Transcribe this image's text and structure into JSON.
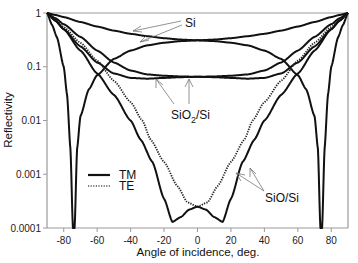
{
  "chart_data": {
    "type": "line",
    "title": "",
    "xlabel": "Angle of incidence, deg.",
    "ylabel": "Reflectivity",
    "xlim": [
      -90,
      90
    ],
    "ylim": [
      0.0001,
      1
    ],
    "yscale": "log",
    "grid": false,
    "x_ticks": [
      -80,
      -60,
      -40,
      -20,
      0,
      20,
      40,
      60,
      80
    ],
    "x_tick_labels": [
      "-80",
      "-60",
      "-40",
      "-20",
      "0",
      "20",
      "40",
      "60",
      "80"
    ],
    "y_ticks": [
      1,
      0.1,
      0.01,
      0.001,
      0.0001
    ],
    "y_tick_labels": [
      "1",
      "0.1",
      "0.01",
      "0.001",
      "0.0001"
    ],
    "legend": {
      "placement": "lower-left",
      "entries": [
        {
          "label": "TM",
          "style": "solid"
        },
        {
          "label": "TE",
          "style": "dotted"
        }
      ]
    },
    "symmetric_about_zero": true,
    "series": [
      {
        "name": "Si TE",
        "style": "solid",
        "x": [
          0,
          10,
          20,
          30,
          40,
          50,
          60,
          70,
          80,
          85,
          90
        ],
        "values": [
          0.31,
          0.32,
          0.34,
          0.37,
          0.41,
          0.47,
          0.56,
          0.68,
          0.84,
          0.92,
          1.0
        ]
      },
      {
        "name": "Si TM",
        "style": "solid",
        "x": [
          0,
          10,
          20,
          30,
          40,
          50,
          60,
          65,
          70,
          72,
          73.5,
          74.5,
          76,
          78,
          80,
          84,
          87,
          90
        ],
        "values": [
          0.31,
          0.3,
          0.28,
          0.25,
          0.2,
          0.14,
          0.07,
          0.038,
          0.012,
          0.003,
          0.0001,
          0.0001,
          0.003,
          0.03,
          0.1,
          0.35,
          0.6,
          1.0
        ]
      },
      {
        "name": "SiO2/Si TE",
        "style": "solid",
        "x": [
          0,
          10,
          20,
          30,
          40,
          50,
          60,
          70,
          80,
          85,
          90
        ],
        "values": [
          0.065,
          0.066,
          0.068,
          0.072,
          0.085,
          0.12,
          0.2,
          0.36,
          0.62,
          0.8,
          1.0
        ]
      },
      {
        "name": "SiO2/Si TM",
        "style": "solid",
        "x": [
          0,
          10,
          20,
          30,
          40,
          50,
          60,
          70,
          80,
          85,
          90
        ],
        "values": [
          0.065,
          0.064,
          0.062,
          0.06,
          0.062,
          0.075,
          0.12,
          0.24,
          0.5,
          0.72,
          1.0
        ]
      },
      {
        "name": "SiO/Si TE",
        "style": "dotted",
        "x": [
          0,
          6,
          12,
          20,
          28,
          33,
          40,
          50,
          60,
          70,
          80,
          85,
          90
        ],
        "values": [
          0.00025,
          0.0003,
          0.0006,
          0.0017,
          0.0044,
          0.01,
          0.022,
          0.055,
          0.13,
          0.28,
          0.55,
          0.75,
          1.0
        ]
      },
      {
        "name": "SiO/Si TM",
        "style": "solid",
        "x": [
          0,
          5,
          10,
          15,
          20,
          27,
          34,
          40,
          50,
          60,
          70,
          80,
          85,
          90
        ],
        "values": [
          0.00025,
          0.00022,
          0.00016,
          0.00013,
          0.00035,
          0.0017,
          0.0044,
          0.01,
          0.03,
          0.075,
          0.2,
          0.5,
          0.72,
          1.0
        ]
      }
    ],
    "annotations": [
      {
        "text": "Si",
        "points_to": "Si TE / Si TM"
      },
      {
        "text": "SiO2/Si",
        "points_to": "SiO2/Si TE / SiO2/Si TM"
      },
      {
        "text": "SiO/Si",
        "points_to": "SiO/Si TE / SiO/Si TM"
      }
    ]
  },
  "labels": {
    "si": "Si",
    "sio2_main": "SiO",
    "sio2_sub": "2",
    "sio2_tail": "/Si",
    "sio": "SiO/Si",
    "tm": "TM",
    "te": "TE",
    "xlabel": "Angle of incidence, deg.",
    "ylabel": "Reflectivity"
  }
}
